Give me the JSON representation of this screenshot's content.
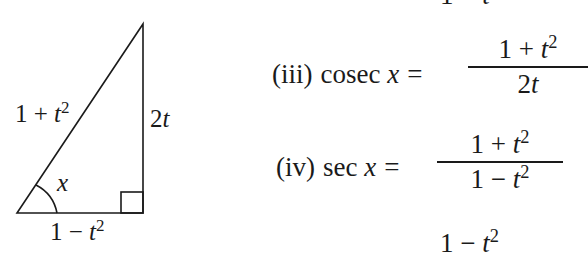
{
  "diagram": {
    "type": "right-triangle",
    "hypotenuse_label": {
      "base": "1 + ",
      "var": "t",
      "exp": "2"
    },
    "opposite_label": {
      "coef": "2",
      "var": "t"
    },
    "adjacent_label": {
      "base": "1 − ",
      "var": "t",
      "exp": "2"
    },
    "angle_label": "x"
  },
  "partial_top": {
    "text_base": "1 − ",
    "var": "t",
    "exp": "2"
  },
  "equations": [
    {
      "index": "(iii)",
      "func": "cosec",
      "var": "x",
      "equals": "=",
      "numerator": {
        "base": "1 + ",
        "var": "t",
        "exp": "2"
      },
      "denominator": {
        "coef": "2",
        "var": "t"
      }
    },
    {
      "index": "(iv)",
      "func": "sec",
      "var": "x",
      "equals": "=",
      "numerator": {
        "base": "1 + ",
        "var": "t",
        "exp": "2"
      },
      "denominator": {
        "base": "1 − ",
        "var": "t",
        "exp": "2"
      }
    }
  ],
  "partial_bottom": {
    "text_base": "1 − ",
    "var": "t",
    "exp": "2"
  }
}
